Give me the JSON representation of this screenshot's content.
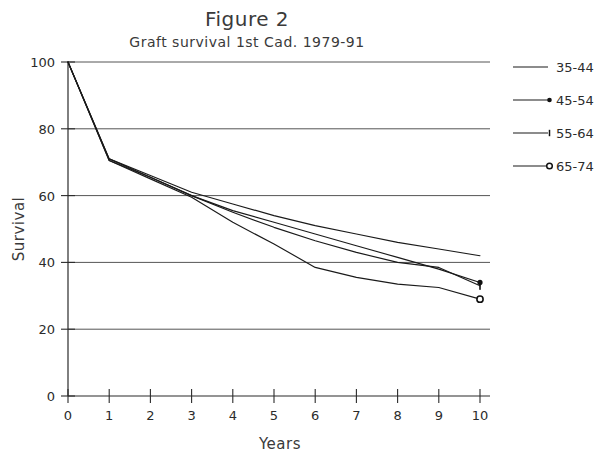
{
  "chart_data": {
    "type": "line",
    "title": "Figure 2",
    "subtitle": "Graft survival 1st Cad. 1979-91",
    "xlabel": "Years",
    "ylabel": "Survival",
    "xlim": [
      0,
      10
    ],
    "ylim": [
      0,
      100
    ],
    "xticks": [
      "0",
      "1",
      "2",
      "3",
      "4",
      "5",
      "6",
      "7",
      "8",
      "9",
      "10"
    ],
    "yticks": [
      "0",
      "20",
      "40",
      "60",
      "80",
      "100"
    ],
    "grid": "horizontal",
    "legend_position": "right",
    "x": [
      0,
      1,
      2,
      3,
      4,
      5,
      6,
      7,
      8,
      9,
      10
    ],
    "series": [
      {
        "name": "35-44",
        "marker": "none",
        "color": "#1a1a1a",
        "x": [
          0,
          1,
          2,
          3,
          4,
          5,
          6,
          7,
          8,
          9,
          10
        ],
        "values": [
          100,
          71,
          66,
          61,
          57.5,
          54,
          51,
          48.5,
          46,
          44,
          42
        ]
      },
      {
        "name": "45-54",
        "marker": "filled-dot",
        "color": "#1a1a1a",
        "x": [
          0,
          1,
          2,
          3,
          4,
          5,
          6,
          7,
          8,
          9,
          10
        ],
        "values": [
          100,
          70.5,
          65.5,
          60,
          55.5,
          52,
          48.5,
          45,
          41.5,
          38,
          34
        ]
      },
      {
        "name": "55-64",
        "marker": "tick",
        "color": "#1a1a1a",
        "x": [
          0,
          1,
          2,
          3,
          4,
          5,
          6,
          7,
          8,
          9,
          10
        ],
        "values": [
          100,
          71,
          65.5,
          60,
          55,
          50.5,
          46.5,
          43,
          40,
          38.5,
          33
        ]
      },
      {
        "name": "65-74",
        "marker": "open-circle",
        "color": "#1a1a1a",
        "x": [
          0,
          1,
          2,
          3,
          4,
          5,
          6,
          7,
          8,
          9,
          10
        ],
        "values": [
          100,
          70.5,
          65,
          59.5,
          52,
          45.5,
          38.5,
          35.5,
          33.5,
          32.5,
          29
        ]
      }
    ],
    "legend": [
      {
        "label": "35-44",
        "marker": "none"
      },
      {
        "label": "45-54",
        "marker": "filled-dot"
      },
      {
        "label": "55-64",
        "marker": "tick"
      },
      {
        "label": "65-74",
        "marker": "open-circle"
      }
    ]
  },
  "axis": {
    "y_label": "Survival",
    "x_label": "Years",
    "y_tick_labels": [
      "100",
      "80",
      "60",
      "40",
      "20",
      "0"
    ],
    "x_tick_labels": [
      "0",
      "1",
      "2",
      "3",
      "4",
      "5",
      "6",
      "7",
      "8",
      "9",
      "10"
    ]
  },
  "header": {
    "title": "Figure 2",
    "subtitle": "Graft survival 1st Cad. 1979-91"
  },
  "legend": {
    "items": [
      {
        "label": "35-44"
      },
      {
        "label": "45-54"
      },
      {
        "label": "55-64"
      },
      {
        "label": "65-74"
      }
    ]
  },
  "colors": {
    "line": "#1a1a1a",
    "grid": "#555555",
    "text": "#2b2b2b",
    "background": "#ffffff"
  }
}
